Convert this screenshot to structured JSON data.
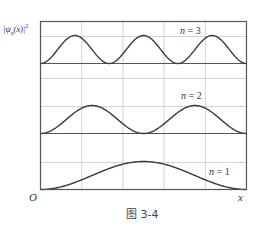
{
  "figure": {
    "caption": "图 3-4",
    "y_axis": {
      "label_prefix": "|ψ",
      "label_sub": "n",
      "label_mid": "(x)|",
      "label_sup": "2"
    },
    "x_axis": {
      "label": "x",
      "origin": "O"
    },
    "panels": [
      {
        "n": 3,
        "label_var": "n",
        "label_eq": " = ",
        "label_val": "3"
      },
      {
        "n": 2,
        "label_var": "n",
        "label_eq": " = ",
        "label_val": "2"
      },
      {
        "n": 1,
        "label_var": "n",
        "label_eq": " = ",
        "label_val": "1"
      }
    ],
    "colors": {
      "curve": "#3a3a3a",
      "frame": "#555555",
      "grid": "#c8c8c8",
      "text": "#333333"
    }
  },
  "chart_data": {
    "type": "line",
    "title": "",
    "caption": "图 3-4",
    "xlabel": "x",
    "ylabel": "|ψn(x)|²",
    "origin_label": "O",
    "grid": true,
    "x_range": [
      0,
      1
    ],
    "x_gridlines": [
      0.2,
      0.4,
      0.6,
      0.8
    ],
    "series": [
      {
        "name": "n = 3",
        "function": "sin^2(3πx)",
        "baseline_offset": 2,
        "peaks_at": [
          0.1667,
          0.5,
          0.8333
        ]
      },
      {
        "name": "n = 2",
        "function": "sin^2(2πx)",
        "baseline_offset": 1,
        "peaks_at": [
          0.25,
          0.75
        ]
      },
      {
        "name": "n = 1",
        "function": "sin^2(πx)",
        "baseline_offset": 0,
        "peaks_at": [
          0.5
        ]
      }
    ]
  }
}
